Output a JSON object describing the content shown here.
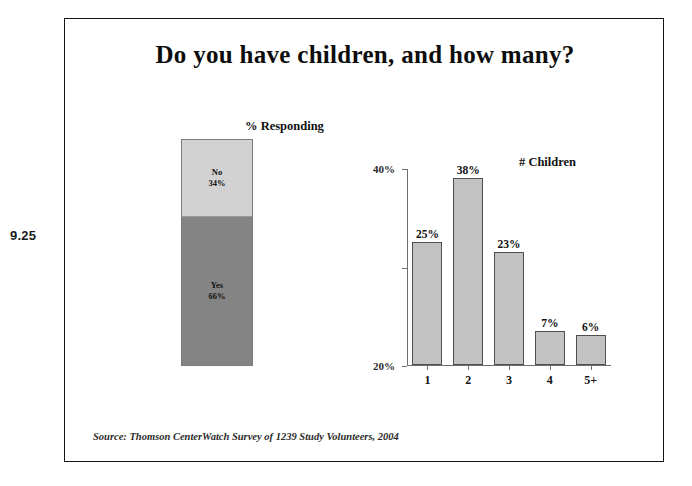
{
  "slide": {
    "number": "9.25",
    "title": "Do you have children, and how many?",
    "source": "Source: Thomson CenterWatch Survey of 1239 Study Volunteers, 2004"
  },
  "colors": {
    "stack_no": "#d2d2d2",
    "stack_yes": "#848484",
    "column_fill": "#c2c2c2",
    "column_border": "#4f4f4f",
    "axis": "#6f6f6f",
    "frame_border": "#141414",
    "text": "#111111"
  },
  "chart_data": [
    {
      "type": "bar",
      "orientation": "stacked-vertical",
      "title": "% Responding",
      "xlabel": "",
      "ylabel": "",
      "ylim": [
        0,
        100
      ],
      "grid": false,
      "legend": "none",
      "categories": [
        "No",
        "Yes"
      ],
      "values": [
        34,
        66
      ],
      "segments": [
        {
          "label": "No",
          "value_label": "34%",
          "value": 34,
          "color": "#d2d2d2"
        },
        {
          "label": "Yes",
          "value_label": "66%",
          "value": 66,
          "color": "#848484"
        }
      ]
    },
    {
      "type": "bar",
      "orientation": "vertical",
      "title": "# Children",
      "xlabel": "",
      "ylabel": "",
      "ylim": [
        0,
        40
      ],
      "yticks": [
        "0%",
        "20%",
        "40%"
      ],
      "ytick_values": [
        0,
        20,
        40
      ],
      "grid": false,
      "legend": "none",
      "categories": [
        "1",
        "2",
        "3",
        "4",
        "5+"
      ],
      "values": [
        25,
        38,
        23,
        7,
        6
      ],
      "value_labels": [
        "25%",
        "38%",
        "23%",
        "7%",
        "6%"
      ]
    }
  ]
}
